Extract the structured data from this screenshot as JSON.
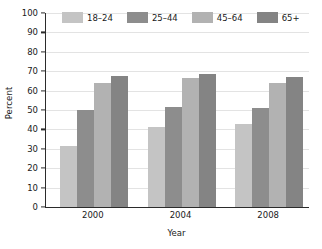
{
  "chart_data": {
    "type": "bar",
    "title": "",
    "subtitle": "",
    "xlabel": "Year",
    "ylabel": "Percent",
    "categories": [
      "2000",
      "2004",
      "2008"
    ],
    "series": [
      {
        "name": "18–24",
        "color": "#c4c4c4",
        "values": [
          31.5,
          41.5,
          43
        ]
      },
      {
        "name": "25–44",
        "color": "#8d8d8d",
        "values": [
          50,
          51.5,
          51
        ]
      },
      {
        "name": "45–64",
        "color": "#b2b2b2",
        "values": [
          64,
          66.5,
          64
        ]
      },
      {
        "name": "65+",
        "color": "#848484",
        "values": [
          67.5,
          68.5,
          67
        ]
      }
    ],
    "ylim": [
      0,
      100
    ],
    "yticks": [
      0,
      10,
      20,
      30,
      40,
      50,
      60,
      70,
      80,
      90,
      100
    ],
    "ytick_labels": [
      "0",
      "10",
      "20",
      "30",
      "40",
      "50",
      "60",
      "70",
      "80",
      "90",
      "100"
    ],
    "grid": true,
    "grid_axis": "y",
    "legend_position": "top-inside",
    "background_color": "#ffffff",
    "axis_color": "#2b2b2b",
    "gridline_color": "#e3e3e3"
  }
}
